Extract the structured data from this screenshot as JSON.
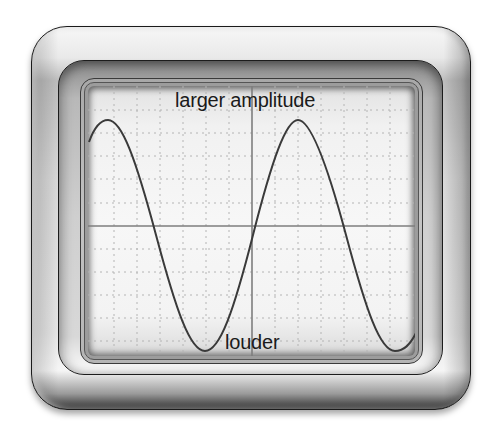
{
  "diagram": {
    "type": "oscilloscope-waveform",
    "labels": {
      "top": "larger amplitude",
      "bottom": "louder"
    },
    "colors": {
      "frame_dark": "#1a1a1a",
      "frame_mid": "#bdbdbd",
      "screen_bg": "#f5f5f5",
      "grid": "#b0b0b0",
      "axis": "#7a7a7a",
      "wave": "#3a3a3a",
      "text": "#1a1a1a"
    },
    "wave": {
      "shape": "sine",
      "cycles_visible": 2,
      "amplitude_relative": "large",
      "peaks": 2,
      "troughs": 2
    },
    "grid": {
      "style": "dotted",
      "center_axes": true
    }
  }
}
